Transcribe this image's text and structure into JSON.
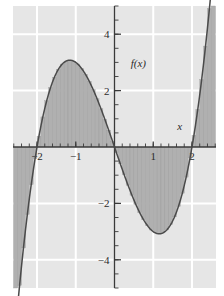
{
  "figure": {
    "kind": "math-function-plot-with-riemann-rectangles",
    "background_color": "#ffffff",
    "plot_background_color": "#e6e6e6",
    "gridline_color": "#ffffff",
    "curve_color": "#4a4a4a",
    "rectangle_fill_color": "#b0b0b0",
    "rectangle_edge_color": "#9a9a9a",
    "axis_color": "#3a3a3a"
  },
  "labels": {
    "y_axis_title": "f(x)",
    "x_axis_title": "x"
  },
  "chart_data": {
    "type": "area",
    "title": "",
    "xlabel": "x",
    "ylabel": "f(x)",
    "xlim": [
      -2.62,
      2.62
    ],
    "ylim": [
      -5.0,
      5.0
    ],
    "grid": true,
    "legend_position": "none",
    "x_ticks_major": [
      -2,
      -1,
      1,
      2
    ],
    "x_tick_labels": [
      "−2",
      "−1",
      "1",
      "2"
    ],
    "y_ticks_major": [
      -4,
      -2,
      2,
      4
    ],
    "y_tick_labels": [
      "−4",
      "−2",
      "2",
      "4"
    ],
    "x_minor_tick_step": 0.2,
    "y_minor_tick_step": 0.5,
    "gridlines_x": [
      -2,
      -1,
      0,
      1,
      2
    ],
    "gridlines_y": [
      -4,
      -2,
      0,
      2,
      4
    ],
    "function_expression": "x^3 - 4x",
    "curve_points_x": [
      -2.6,
      -2.5,
      -2.4,
      -2.3,
      -2.2,
      -2.1,
      -2.0,
      -1.9,
      -1.8,
      -1.7,
      -1.6,
      -1.5,
      -1.4,
      -1.3,
      -1.2,
      -1.1,
      -1.0,
      -0.9,
      -0.8,
      -0.7,
      -0.6,
      -0.5,
      -0.4,
      -0.3,
      -0.2,
      -0.1,
      0.0,
      0.1,
      0.2,
      0.3,
      0.4,
      0.5,
      0.6,
      0.7,
      0.8,
      0.9,
      1.0,
      1.1,
      1.2,
      1.3,
      1.4,
      1.5,
      1.6,
      1.7,
      1.8,
      1.9,
      2.0,
      2.1,
      2.2,
      2.3,
      2.4,
      2.5,
      2.6
    ],
    "curve_points_y": [
      -7.18,
      -5.63,
      -4.22,
      -2.97,
      -1.85,
      -0.86,
      0.0,
      0.74,
      1.37,
      1.89,
      2.31,
      2.63,
      2.86,
      3.01,
      3.07,
      3.07,
      3.0,
      2.87,
      2.69,
      2.46,
      2.18,
      1.88,
      1.54,
      1.17,
      0.79,
      0.4,
      0.0,
      -0.4,
      -0.79,
      -1.17,
      -1.54,
      -1.88,
      -2.18,
      -2.46,
      -2.69,
      -2.87,
      -3.0,
      -3.07,
      -3.07,
      -3.01,
      -2.86,
      -2.63,
      -2.31,
      -1.89,
      -1.37,
      -0.74,
      0.0,
      0.86,
      1.85,
      2.97,
      4.22,
      5.63,
      7.18
    ],
    "riemann": {
      "rule": "midpoint",
      "interval": [
        -2.6,
        2.6
      ],
      "n_rectangles": 52,
      "rect_width": 0.1,
      "shaded_between_curve_and_x_axis": true
    },
    "annotations": [
      {
        "text": "f(x)",
        "x": 0.42,
        "y": 2.85,
        "style": "italic"
      },
      {
        "text": "x",
        "x": 1.62,
        "y": 0.62,
        "style": "italic"
      }
    ],
    "features": {
      "local_maximum": {
        "x": -1.155,
        "y": 3.079
      },
      "local_minimum": {
        "x": 1.155,
        "y": -3.079
      },
      "roots": [
        -2.0,
        0.0,
        2.0
      ]
    }
  }
}
